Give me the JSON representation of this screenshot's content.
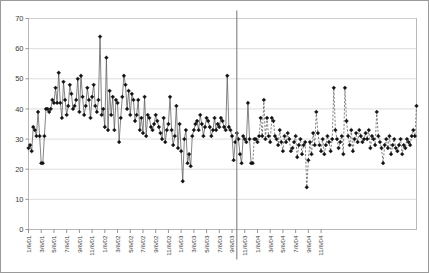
{
  "chart_data": {
    "type": "line",
    "title": "",
    "subtitle": "",
    "xlabel": "",
    "ylabel": "",
    "ylim": [
      0,
      70
    ],
    "ytick_values": [
      0,
      10,
      20,
      30,
      40,
      50,
      60,
      70
    ],
    "ytick_labels": [
      "0",
      "10",
      "20",
      "30",
      "40",
      "50",
      "60",
      "70"
    ],
    "grid": true,
    "grid_axis": "y",
    "legend": false,
    "legend_position": "none",
    "marker": "diamond",
    "marker_color": "#000000",
    "line_color": "#595959",
    "divider": {
      "label": "9/6/03",
      "x_index": 131,
      "color": "#808080",
      "note": "vertical separator between observed (solid line) and forecast (dashed line) segments"
    },
    "xtick_labels": [
      "1/6/01",
      "3/6/01",
      "5/6/01",
      "7/6/01",
      "9/6/01",
      "11/6/01",
      "1/6/02",
      "3/6/02",
      "5/6/02",
      "7/6/02",
      "9/6/02",
      "11/6/02",
      "1/6/03",
      "3/6/03",
      "5/6/03",
      "7/6/03",
      "9/6/03",
      "11/6/03",
      "1/6/04",
      "3/6/04",
      "5/6/04",
      "7/6/04",
      "9/6/04",
      "11/6/04"
    ],
    "xtick_interval_points": 8,
    "series": [
      {
        "name": "observed",
        "style": "solid",
        "values": [
          27,
          28,
          26,
          34,
          33,
          31,
          39,
          31,
          22,
          22,
          31,
          40,
          40,
          39,
          40,
          43,
          42,
          47,
          42,
          52,
          42,
          37,
          49,
          43,
          38,
          41,
          48,
          45,
          40,
          41,
          43,
          50,
          39,
          51,
          44,
          38,
          41,
          47,
          43,
          37,
          44,
          48,
          41,
          39,
          43,
          64,
          38,
          40,
          34,
          57,
          33,
          46,
          38,
          44,
          33,
          43,
          42,
          29,
          37,
          44,
          51,
          48,
          40,
          46,
          38,
          45,
          43,
          36,
          38,
          43,
          33,
          37,
          32,
          44,
          31,
          38,
          37,
          34,
          33,
          35,
          38,
          36,
          34,
          32,
          30,
          37,
          29,
          33,
          35,
          44,
          33,
          28,
          31,
          41,
          27,
          35,
          26,
          16,
          30,
          33,
          22,
          25,
          21,
          31,
          33,
          35,
          36,
          33,
          38,
          35,
          31,
          34,
          37,
          36,
          34,
          31,
          33,
          37,
          33,
          35,
          34,
          37,
          36,
          34,
          33,
          51,
          34,
          33,
          31,
          23,
          29,
          32,
          30,
          25,
          22,
          31,
          30,
          29,
          42,
          30,
          22
        ]
      },
      {
        "name": "forecast",
        "style": "dashed",
        "values": [
          22,
          30,
          30,
          29,
          31,
          37,
          31,
          43,
          30,
          37,
          31,
          29,
          37,
          36,
          31,
          30,
          28,
          33,
          29,
          26,
          31,
          29,
          32,
          30,
          26,
          27,
          29,
          31,
          24,
          28,
          30,
          25,
          28,
          29,
          14,
          23,
          29,
          25,
          32,
          28,
          39,
          32,
          28,
          26,
          30,
          25,
          28,
          31,
          29,
          26,
          30,
          47,
          33,
          30,
          27,
          29,
          31,
          25,
          47,
          36,
          31,
          28,
          33,
          26,
          30,
          32,
          29,
          33,
          31,
          29,
          30,
          32,
          30,
          33,
          27,
          31,
          30,
          28,
          39,
          31,
          29,
          27,
          22,
          28,
          30,
          27,
          31,
          25,
          28,
          30,
          27,
          26,
          28,
          30,
          25,
          28,
          27,
          30,
          29,
          28,
          31,
          33,
          31,
          41
        ]
      }
    ]
  }
}
